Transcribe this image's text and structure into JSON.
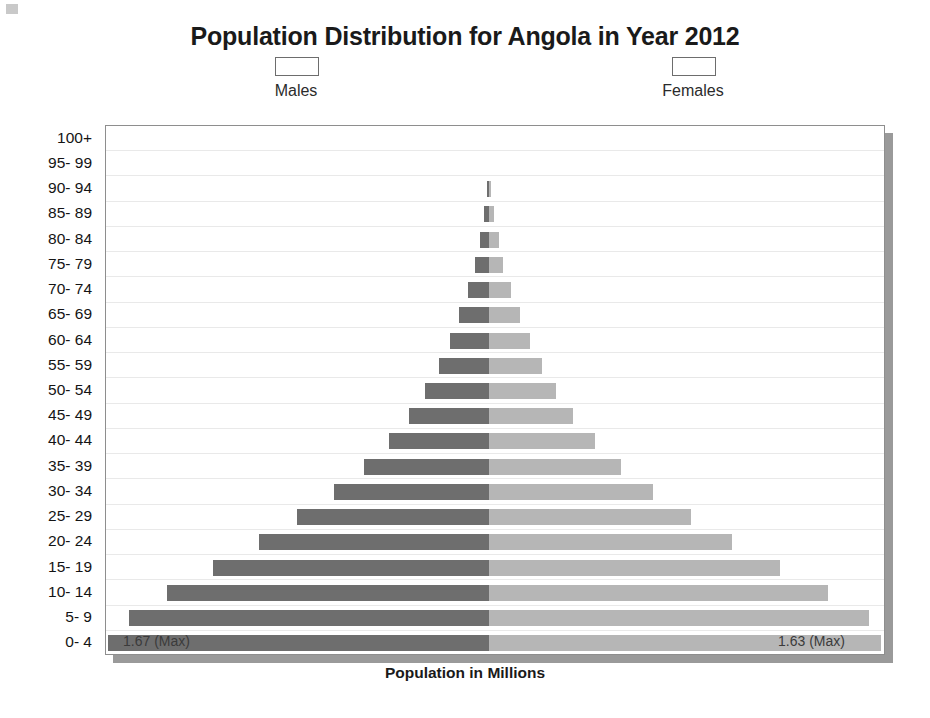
{
  "chart_data": {
    "type": "bar",
    "subtype": "population-pyramid",
    "title": "Population Distribution for Angola in Year 2012",
    "xlabel": "Population in Millions",
    "ylabel": "",
    "grid": true,
    "legend_position": "top",
    "xlim": [
      -1.67,
      1.63
    ],
    "axis_note": "Horizontal axis is symmetric about zero; males extend left, females extend right. No numeric tick labels are drawn on the x axis.",
    "categories": [
      "100+",
      "95- 99",
      "90- 94",
      "85- 89",
      "80- 84",
      "75- 79",
      "70- 74",
      "65- 69",
      "60- 64",
      "55- 59",
      "50- 54",
      "45- 49",
      "40- 44",
      "35- 39",
      "30- 34",
      "25- 29",
      "20- 24",
      "15- 19",
      "10- 14",
      "5- 9",
      "0- 4"
    ],
    "series": [
      {
        "name": "Males",
        "color": "#6e6e6e",
        "direction": "left",
        "values": [
          0.0,
          0.0,
          0.01,
          0.02,
          0.04,
          0.06,
          0.09,
          0.13,
          0.17,
          0.22,
          0.28,
          0.35,
          0.44,
          0.55,
          0.68,
          0.84,
          1.01,
          1.21,
          1.41,
          1.58,
          1.67
        ]
      },
      {
        "name": "Females",
        "color": "#b6b6b6",
        "direction": "right",
        "values": [
          0.0,
          0.0,
          0.01,
          0.02,
          0.04,
          0.06,
          0.09,
          0.13,
          0.17,
          0.22,
          0.28,
          0.35,
          0.44,
          0.55,
          0.68,
          0.84,
          1.01,
          1.21,
          1.41,
          1.58,
          1.63
        ]
      }
    ],
    "annotations": [
      {
        "id": "max-male",
        "text": "1.67 (Max)",
        "series": "Males",
        "category": "0- 4"
      },
      {
        "id": "max-female",
        "text": "1.63 (Max)",
        "series": "Females",
        "category": "0- 4"
      }
    ]
  },
  "legend": {
    "males": {
      "label": "Males",
      "color": "#6e6e6e"
    },
    "females": {
      "label": "Females",
      "color": "#b6b6b6"
    }
  }
}
